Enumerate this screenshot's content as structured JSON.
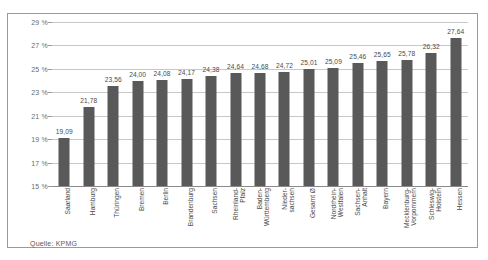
{
  "chart_data": {
    "type": "bar",
    "title": "",
    "subtitle": "",
    "xlabel": "",
    "ylabel": "",
    "ylim": [
      15,
      29
    ],
    "ytick_labels": [
      "29 %",
      "27 %",
      "25 %",
      "23 %",
      "21 %",
      "19 %",
      "17 %",
      "15 %"
    ],
    "ytick_values": [
      29,
      27,
      25,
      23,
      21,
      19,
      17,
      15
    ],
    "grid": true,
    "legend": "none",
    "categories": [
      "Saarland",
      "Hamburg",
      "Thüringen",
      "Bremen",
      "Berlin",
      "Brandenburg",
      "Sachsen",
      "Rheinland-Pfalz",
      "Baden-Württemberg",
      "Nieder-sachsen",
      "Gesamt Ø",
      "Nordrhein-Westfalen",
      "Sachsen-Anhalt",
      "Bayern",
      "Mecklenburg-Vorpommern",
      "Schleswig-Holstein",
      "Hessen"
    ],
    "category_lines": [
      [
        "Saarland"
      ],
      [
        "Hamburg"
      ],
      [
        "Thüringen"
      ],
      [
        "Bremen"
      ],
      [
        "Berlin"
      ],
      [
        "Brandenburg"
      ],
      [
        "Sachsen"
      ],
      [
        "Rheinland-",
        "Pfalz"
      ],
      [
        "Baden-",
        "Württemberg"
      ],
      [
        "Nieder-",
        "sachsen"
      ],
      [
        "Gesamt Ø"
      ],
      [
        "Nordrhein-",
        "Westfalen"
      ],
      [
        "Sachsen-",
        "Anhalt"
      ],
      [
        "Bayern"
      ],
      [
        "Mecklenburg-",
        "Vorpommern"
      ],
      [
        "Schleswig-",
        "Holstein"
      ],
      [
        "Hessen"
      ]
    ],
    "values": [
      19.09,
      21.78,
      23.56,
      24.0,
      24.08,
      24.17,
      24.38,
      24.64,
      24.68,
      24.72,
      25.01,
      25.09,
      25.46,
      25.65,
      25.78,
      26.32,
      27.64
    ],
    "value_labels": [
      "19,09",
      "21,78",
      "23,56",
      "24,00",
      "24,08",
      "24,17",
      "24,38",
      "24,64",
      "24,68",
      "24,72",
      "25,01",
      "25,09",
      "25,46",
      "25,65",
      "25,78",
      "26,32",
      "27,64"
    ],
    "bar_color": "#595959",
    "grid_color": "#c8c8c8"
  },
  "footer": {
    "source": "Quelle: KPMG"
  }
}
